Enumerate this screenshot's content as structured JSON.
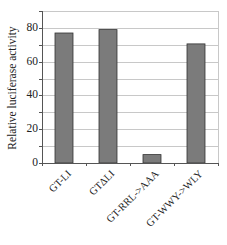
{
  "chart_data": {
    "type": "bar",
    "title": "",
    "xlabel": "",
    "ylabel": "Relative luciferase activity",
    "categories": [
      "GT-LI",
      "GTΔLI",
      "GT-RRL->AAA",
      "GT-WWY->WLY"
    ],
    "values": [
      77,
      79,
      5,
      70.5
    ],
    "ylim": [
      0,
      90
    ],
    "yticks": [
      0,
      20,
      40,
      60,
      80
    ],
    "grid": true,
    "gridline_step": 10,
    "legend": null,
    "colors": {
      "bar_fill": "#7b7b7b",
      "bar_edge": "#333333",
      "grid": "#c8c8c8",
      "axis": "#555555"
    }
  },
  "labels": {
    "ylabel": "Relative luciferase activity",
    "yticks": [
      "0",
      "20",
      "40",
      "60",
      "80"
    ],
    "xticks": [
      "GT-LI",
      "GTΔLI",
      "GT-RRL->AAA",
      "GT-WWY->WLY"
    ]
  }
}
